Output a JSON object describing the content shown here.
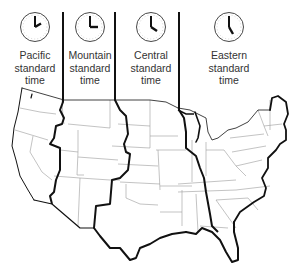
{
  "colors": {
    "background": "#ffffff",
    "coastline": "#111111",
    "zone_boundary": "#111111",
    "state_border": "#9a9a9a",
    "text": "#333333"
  },
  "zones": [
    {
      "name": "Pacific",
      "line1": "Pacific",
      "line2": "standard",
      "line3": "time",
      "clock_time": "2:00",
      "hour": 2,
      "minute": 0
    },
    {
      "name": "Mountain",
      "line1": "Mountain",
      "line2": "standard",
      "line3": "time",
      "clock_time": "3:00",
      "hour": 3,
      "minute": 0
    },
    {
      "name": "Central",
      "line1": "Central",
      "line2": "standard",
      "line3": "time",
      "clock_time": "4:00",
      "hour": 4,
      "minute": 0
    },
    {
      "name": "Eastern",
      "line1": "Eastern",
      "line2": "standard",
      "line3": "time",
      "clock_time": "5:00",
      "hour": 5,
      "minute": 0
    }
  ]
}
